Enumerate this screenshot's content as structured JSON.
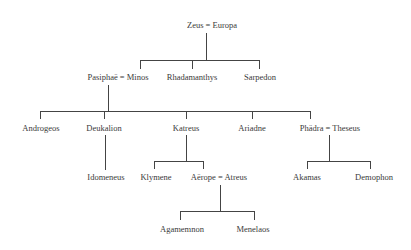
{
  "nodes": {
    "zeus_europa": "Zeus = Europa",
    "pasiphae_minos": "Pasiphaë = Minos",
    "rhadamanthys": "Rhadamanthys",
    "sarpedon": "Sarpedon",
    "androgeos": "Androgeos",
    "deukalion": "Deukalion",
    "katreus": "Katreus",
    "ariadne": "Ariadne",
    "phadra_theseus": "Phädra = Theseus",
    "idomeneus": "Idomeneus",
    "klymene": "Klymene",
    "aerope_atreus": "Aërope = Atreus",
    "akamas": "Akamas",
    "demophon": "Demophon",
    "agamemnon": "Agamemnon",
    "menelaos": "Menelaos"
  },
  "colors": {
    "line": "#444444",
    "text": "#3a3a3a",
    "background": "#ffffff"
  }
}
